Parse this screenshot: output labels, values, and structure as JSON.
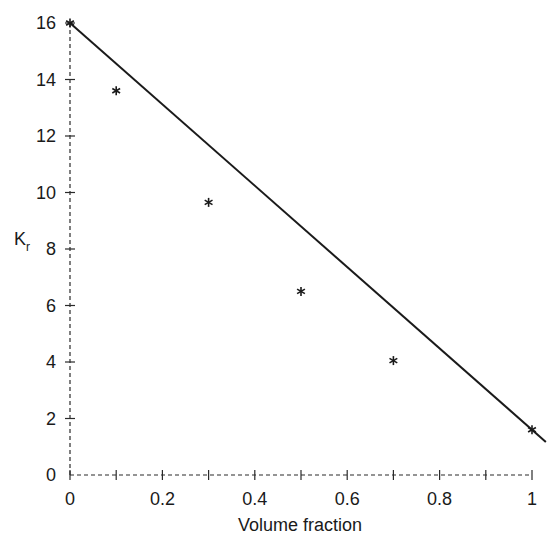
{
  "chart_data": {
    "type": "scatter",
    "title": "",
    "xlabel": "Volume fraction",
    "ylabel": "K",
    "ylabel_subscript": "r",
    "xlim": [
      0,
      1
    ],
    "ylim": [
      0,
      16
    ],
    "grid": false,
    "legend": null,
    "x_ticks": [
      0,
      0.1,
      0.2,
      0.3,
      0.4,
      0.5,
      0.6,
      0.7,
      0.8,
      0.9,
      1
    ],
    "x_tick_labels": [
      "0",
      "",
      "0.2",
      "",
      "0.4",
      "",
      "0.6",
      "",
      "0.8",
      "",
      "1"
    ],
    "y_ticks": [
      0,
      2,
      4,
      6,
      8,
      10,
      12,
      14,
      16
    ],
    "y_tick_labels": [
      "0",
      "2",
      "4",
      "6",
      "8",
      "10",
      "12",
      "14",
      "16"
    ],
    "series": [
      {
        "name": "measured",
        "style": "marker",
        "marker": "asterisk",
        "x": [
          0,
          0.1,
          0.3,
          0.5,
          0.7,
          1.0
        ],
        "y": [
          16.0,
          13.6,
          9.65,
          6.5,
          4.05,
          1.6
        ]
      },
      {
        "name": "linear rule of mixtures",
        "style": "line",
        "x": [
          0,
          1.03
        ],
        "y": [
          16.0,
          1.17
        ]
      }
    ]
  },
  "axes": {
    "x_label": "Volume fraction",
    "y_label_main": "K",
    "y_label_sub": "r"
  }
}
